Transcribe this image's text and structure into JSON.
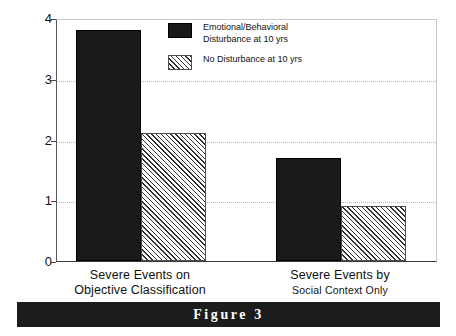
{
  "figure": {
    "caption": "Figure 3",
    "banner_color": "#1c1c1c",
    "banner_text_color": "#ffffff"
  },
  "chart_data": {
    "type": "bar",
    "title": "",
    "xlabel": "",
    "ylabel": "Mean No. of Severe Events",
    "ylim": [
      0,
      4
    ],
    "yticks": [
      0,
      1,
      2,
      3,
      4
    ],
    "ytick_labels": [
      "0",
      "1",
      "2",
      "3",
      "4"
    ],
    "grid": true,
    "grid_axis": "y",
    "gridlines_at": [
      1,
      2,
      3
    ],
    "legend_position": "upper-center",
    "categories": [
      "Severe Events on Objective Classification",
      "Severe Events by Social Context Only"
    ],
    "category_lines": [
      {
        "line1": "Severe Events on",
        "line2": "Objective Classification",
        "second_line_smaller": false
      },
      {
        "line1": "Severe Events by",
        "line2": "Social Context Only",
        "second_line_smaller": true
      }
    ],
    "series": [
      {
        "name": "Emotional/Behavioral Disturbance at 10 yrs",
        "legend_label_lines": [
          "Emotional/Behavioral",
          "Disturbance at 10 yrs"
        ],
        "fill": "solid",
        "color": "#1a1a1a",
        "values": [
          3.8,
          1.7
        ]
      },
      {
        "name": "No Disturbance at 10 yrs",
        "legend_label_lines": [
          "No Disturbance at 10 yrs"
        ],
        "fill": "hatched-diagonal",
        "color": "#2e2e2e",
        "values": [
          2.1,
          0.9
        ]
      }
    ]
  }
}
